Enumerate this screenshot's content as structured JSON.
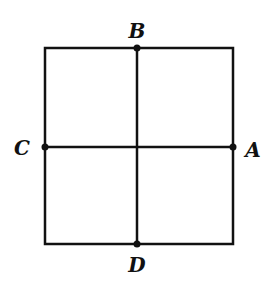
{
  "diagram": {
    "type": "square-divided-into-quadrants",
    "square": {
      "left": 45,
      "top": 48,
      "right": 233,
      "bottom": 244
    },
    "center": {
      "x": 137,
      "y": 147
    },
    "stroke_color": "#111111",
    "points": [
      {
        "id": "B",
        "label": "B",
        "x": 137,
        "y": 48,
        "label_x": 137,
        "label_y": 31
      },
      {
        "id": "C",
        "label": "C",
        "x": 45,
        "y": 147,
        "label_x": 22,
        "label_y": 148
      },
      {
        "id": "A",
        "label": "A",
        "x": 233,
        "y": 147,
        "label_x": 253,
        "label_y": 150
      },
      {
        "id": "D",
        "label": "D",
        "x": 137,
        "y": 244,
        "label_x": 137,
        "label_y": 264
      }
    ]
  },
  "labels": {
    "A": "A",
    "B": "B",
    "C": "C",
    "D": "D"
  }
}
